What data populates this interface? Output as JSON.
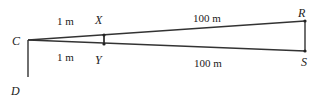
{
  "diagram": {
    "points": {
      "C": {
        "label": "C",
        "x": 28,
        "y": 40
      },
      "D": {
        "label": "D",
        "x": 28,
        "y": 77
      },
      "X": {
        "label": "X",
        "x": 104,
        "y": 35
      },
      "Y": {
        "label": "Y",
        "x": 104,
        "y": 44
      },
      "R": {
        "label": "R",
        "x": 305,
        "y": 21
      },
      "S": {
        "label": "S",
        "x": 305,
        "y": 51
      }
    },
    "labels": {
      "cx_distance": "1 m",
      "cy_distance": "1 m",
      "xr_distance": "100 m",
      "ys_distance": "100 m"
    },
    "colors": {
      "line": "#333333",
      "text": "#222222"
    }
  }
}
